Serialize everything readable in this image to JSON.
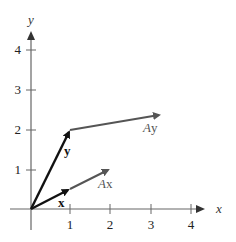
{
  "figure": {
    "axes": {
      "x_label": "x",
      "y_label": "y",
      "x_ticks": [
        "1",
        "2",
        "3",
        "4"
      ],
      "y_ticks": [
        "1",
        "2",
        "3",
        "4"
      ]
    },
    "vectors": [
      {
        "name": "x",
        "label": "x",
        "from": [
          0,
          0
        ],
        "to": [
          1,
          0.5
        ],
        "color": "#111111",
        "style": "bold"
      },
      {
        "name": "y",
        "label": "y",
        "from": [
          0,
          0
        ],
        "to": [
          1,
          2
        ],
        "color": "#111111",
        "style": "bold"
      },
      {
        "name": "Ax",
        "label_prefix": "A",
        "label_vec": "x",
        "from": [
          1,
          0.5
        ],
        "to": [
          2,
          1
        ],
        "color": "#555555"
      },
      {
        "name": "Ay",
        "label_prefix": "A",
        "label_vec": "y",
        "from": [
          1,
          2
        ],
        "to": [
          3.25,
          2.4
        ],
        "color": "#555555"
      }
    ],
    "colors": {
      "axis": "#555555",
      "original_vectors": "#111111",
      "transformed_vectors": "#555555"
    }
  }
}
